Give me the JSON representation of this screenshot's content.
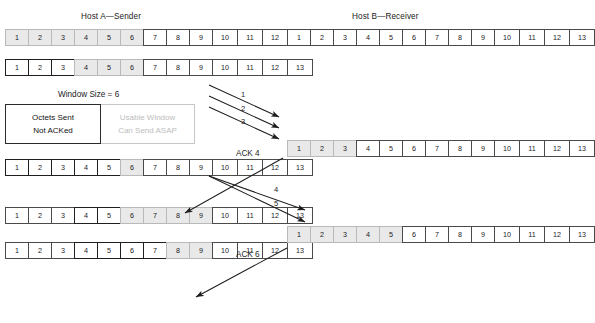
{
  "diagram": {
    "hosts": {
      "sender_title": "Host A—Sender",
      "receiver_title": "Host B—Receiver"
    },
    "legend": {
      "title": "Window Size = 6",
      "sent_line1": "Octets Sent",
      "sent_line2": "Not ACKed",
      "usable_line1": "Usable Window",
      "usable_line2": "Can Send ASAP"
    },
    "octet_labels": [
      "1",
      "2",
      "3",
      "4",
      "5",
      "6",
      "7",
      "8",
      "9",
      "10",
      "11",
      "12",
      "13"
    ],
    "sender_rows": [
      {
        "name": "sender-row-1",
        "states": [
          "window",
          "window",
          "window",
          "window",
          "window",
          "window",
          "plain",
          "plain",
          "plain",
          "plain",
          "plain",
          "plain",
          "plain"
        ]
      },
      {
        "name": "sender-row-2",
        "states": [
          "sent",
          "sent",
          "sent",
          "window",
          "window",
          "window",
          "plain",
          "plain",
          "plain",
          "plain",
          "plain",
          "plain",
          "plain"
        ]
      },
      {
        "name": "sender-row-3",
        "states": [
          "sent",
          "sent",
          "sent",
          "sent",
          "sent",
          "window",
          "plain",
          "plain",
          "plain",
          "plain",
          "plain",
          "plain",
          "plain"
        ]
      },
      {
        "name": "sender-row-4",
        "states": [
          "plain",
          "plain",
          "plain",
          "sent",
          "sent",
          "window",
          "window",
          "window",
          "window",
          "plain",
          "plain",
          "plain",
          "plain"
        ]
      },
      {
        "name": "sender-row-5",
        "states": [
          "plain",
          "plain",
          "plain",
          "sent",
          "sent",
          "sent",
          "sent",
          "window",
          "window",
          "plain",
          "plain",
          "plain",
          "plain"
        ]
      }
    ],
    "receiver_rows": [
      {
        "name": "receiver-row-1",
        "states": [
          "plain",
          "plain",
          "plain",
          "plain",
          "plain",
          "plain",
          "plain",
          "plain",
          "plain",
          "plain",
          "plain",
          "plain",
          "plain"
        ]
      },
      {
        "name": "receiver-row-2",
        "states": [
          "window",
          "window",
          "window",
          "plain",
          "plain",
          "plain",
          "plain",
          "plain",
          "plain",
          "plain",
          "plain",
          "plain",
          "plain"
        ]
      },
      {
        "name": "receiver-row-3",
        "states": [
          "window",
          "window",
          "window",
          "window",
          "window",
          "plain",
          "plain",
          "plain",
          "plain",
          "plain",
          "plain",
          "plain",
          "plain"
        ]
      }
    ],
    "arrows": [
      {
        "name": "segment-1",
        "label": "1",
        "direction": "sender-to-receiver"
      },
      {
        "name": "segment-2",
        "label": "2",
        "direction": "sender-to-receiver"
      },
      {
        "name": "segment-3",
        "label": "3",
        "direction": "sender-to-receiver"
      },
      {
        "name": "ack-4",
        "label": "ACK 4",
        "direction": "receiver-to-sender"
      },
      {
        "name": "segment-4",
        "label": "4",
        "direction": "sender-to-receiver"
      },
      {
        "name": "segment-5",
        "label": "5",
        "direction": "sender-to-receiver"
      },
      {
        "name": "ack-6",
        "label": "ACK 6",
        "direction": "receiver-to-sender"
      }
    ]
  },
  "colors": {
    "sent_border": "#1f1f1f",
    "window_fill": "#e9e9e9",
    "window_border": "#b9b9b9",
    "plain_border": "#4a4a4a",
    "arrow": "#1d1d1d",
    "muted_text": "#bdbdbd"
  }
}
